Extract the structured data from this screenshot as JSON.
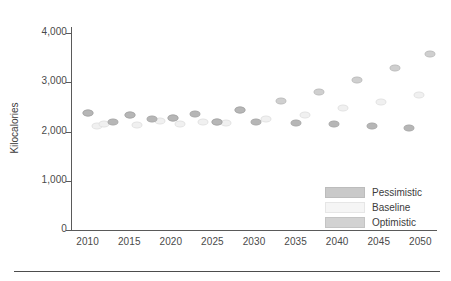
{
  "chart_data": {
    "type": "scatter",
    "title": "",
    "xlabel": "",
    "ylabel": "Kilocalories",
    "xlim": [
      2008,
      2052
    ],
    "ylim": [
      0,
      4000
    ],
    "grid": false,
    "legend_position": "bottom-right",
    "y_ticks": [
      0,
      1000,
      2000,
      3000,
      4000
    ],
    "y_tick_labels": [
      "0",
      "1,000",
      "2,000",
      "3,000",
      "4,000"
    ],
    "x_ticks": [
      2010,
      2015,
      2020,
      2025,
      2030,
      2035,
      2040,
      2045,
      2050
    ],
    "x_tick_labels": [
      "2010",
      "2015",
      "2020",
      "2025",
      "2030",
      "2035",
      "2040",
      "2045",
      "2050"
    ],
    "series": [
      {
        "name": "Pessimistic",
        "color": "#b6b6b6",
        "x": [
          2009,
          2011,
          2014,
          2016,
          2019,
          2021,
          2024,
          2026,
          2029,
          2031,
          2034,
          2036,
          2039,
          2041,
          2044,
          2046,
          2049,
          2051
        ],
        "values": [
          2390,
          2180,
          2345,
          2255,
          2285,
          2365,
          2200,
          2450,
          2180,
          2625,
          2165,
          2195,
          2135,
          2105,
          2090,
          2080,
          2060,
          2055
        ]
      },
      {
        "name": "Baseline",
        "color": "#f0f0f0",
        "x": [
          2010,
          2012,
          2015,
          2017,
          2020,
          2022,
          2025,
          2027,
          2030,
          2032,
          2035,
          2037,
          2040,
          2042,
          2045,
          2047,
          2050,
          2051
        ],
        "values": [
          2110,
          2175,
          2145,
          2230,
          2160,
          2200,
          2180,
          2250,
          2265,
          2300,
          2350,
          2400,
          2480,
          2530,
          2615,
          2660,
          2740,
          2745
        ]
      },
      {
        "name": "Optimistic",
        "color": "#cfcfcf",
        "x": [
          2009,
          2014,
          2019,
          2024,
          2029,
          2031,
          2036,
          2041,
          2046,
          2051
        ],
        "values": [
          2390,
          2345,
          2285,
          2450,
          2625,
          2630,
          2810,
          3040,
          3310,
          3605
        ]
      }
    ],
    "points": [
      {
        "series": "Pessimistic",
        "x_px": 88,
        "y_px": 113,
        "year": 2009,
        "value": 2390
      },
      {
        "series": "Baseline",
        "x_px": 97,
        "y_px": 126,
        "year": 2010,
        "value": 2110
      },
      {
        "series": "Optimistic",
        "x_px": 88,
        "y_px": 113,
        "year": 2009,
        "value": 2390
      },
      {
        "series": "Pessimistic",
        "x_px": 113,
        "y_px": 122,
        "year": 2011,
        "value": 2180
      },
      {
        "series": "Baseline",
        "x_px": 104,
        "y_px": 124,
        "year": 2012,
        "value": 2175
      },
      {
        "series": "Pessimistic",
        "x_px": 130,
        "y_px": 115,
        "year": 2014,
        "value": 2345
      },
      {
        "series": "Optimistic",
        "x_px": 130,
        "y_px": 115,
        "year": 2014,
        "value": 2345
      },
      {
        "series": "Baseline",
        "x_px": 137,
        "y_px": 125,
        "year": 2015,
        "value": 2145
      },
      {
        "series": "Pessimistic",
        "x_px": 152,
        "y_px": 119,
        "year": 2016,
        "value": 2255
      },
      {
        "series": "Baseline",
        "x_px": 160,
        "y_px": 121,
        "year": 2017,
        "value": 2230
      },
      {
        "series": "Pessimistic",
        "x_px": 173,
        "y_px": 118,
        "year": 2019,
        "value": 2285
      },
      {
        "series": "Optimistic",
        "x_px": 173,
        "y_px": 118,
        "year": 2019,
        "value": 2285
      },
      {
        "series": "Baseline",
        "x_px": 180,
        "y_px": 124,
        "year": 2020,
        "value": 2160
      },
      {
        "series": "Pessimistic",
        "x_px": 195,
        "y_px": 114,
        "year": 2021,
        "value": 2365
      },
      {
        "series": "Baseline",
        "x_px": 203,
        "y_px": 122,
        "year": 2022,
        "value": 2200
      },
      {
        "series": "Pessimistic",
        "x_px": 217,
        "y_px": 122,
        "year": 2024,
        "value": 2200
      },
      {
        "series": "Optimistic",
        "x_px": 217,
        "y_px": 122,
        "year": 2024,
        "value": 2200
      },
      {
        "series": "Baseline",
        "x_px": 226,
        "y_px": 123,
        "year": 2025,
        "value": 2180
      },
      {
        "series": "Pessimistic",
        "x_px": 240,
        "y_px": 110,
        "year": 2026,
        "value": 2450
      },
      {
        "series": "Optimistic",
        "x_px": 240,
        "y_px": 110,
        "year": 2026,
        "value": 2450
      },
      {
        "series": "Pessimistic",
        "x_px": 256,
        "y_px": 122,
        "year": 2029,
        "value": 2180
      },
      {
        "series": "Baseline",
        "x_px": 266,
        "y_px": 119,
        "year": 2030,
        "value": 2265
      },
      {
        "series": "Optimistic",
        "x_px": 281,
        "y_px": 101,
        "year": 2031,
        "value": 2625
      },
      {
        "series": "Pessimistic",
        "x_px": 296,
        "y_px": 123,
        "year": 2034,
        "value": 2165
      },
      {
        "series": "Baseline",
        "x_px": 305,
        "y_px": 115,
        "year": 2035,
        "value": 2350
      },
      {
        "series": "Optimistic",
        "x_px": 319,
        "y_px": 92,
        "year": 2036,
        "value": 2810
      },
      {
        "series": "Pessimistic",
        "x_px": 334,
        "y_px": 124,
        "year": 2039,
        "value": 2135
      },
      {
        "series": "Baseline",
        "x_px": 343,
        "y_px": 108,
        "year": 2040,
        "value": 2480
      },
      {
        "series": "Optimistic",
        "x_px": 357,
        "y_px": 80,
        "year": 2041,
        "value": 3040
      },
      {
        "series": "Pessimistic",
        "x_px": 372,
        "y_px": 126,
        "year": 2044,
        "value": 2090
      },
      {
        "series": "Baseline",
        "x_px": 381,
        "y_px": 102,
        "year": 2045,
        "value": 2615
      },
      {
        "series": "Optimistic",
        "x_px": 395,
        "y_px": 68,
        "year": 2046,
        "value": 3310
      },
      {
        "series": "Pessimistic",
        "x_px": 409,
        "y_px": 128,
        "year": 2049,
        "value": 2060
      },
      {
        "series": "Baseline",
        "x_px": 419,
        "y_px": 95,
        "year": 2050,
        "value": 2740
      },
      {
        "series": "Optimistic",
        "x_px": 430,
        "y_px": 54,
        "year": 2051,
        "value": 3605
      }
    ],
    "legend": [
      {
        "label": "Pessimistic",
        "color": "#c9c9c9"
      },
      {
        "label": "Baseline",
        "color": "#f5f5f5"
      },
      {
        "label": "Optimistic",
        "color": "#d2d2d2"
      }
    ]
  }
}
